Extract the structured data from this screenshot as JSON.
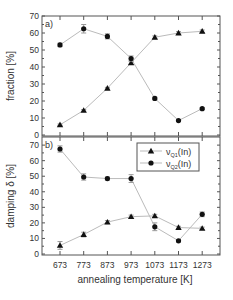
{
  "chart_data": [
    {
      "type": "line",
      "panel_label": "a)",
      "title": "",
      "xlabel": "",
      "ylabel": "fraction [%]",
      "x": [
        673,
        773,
        873,
        973,
        1073,
        1173,
        1273
      ],
      "ylim": [
        0,
        70
      ],
      "yticks": [
        0,
        10,
        20,
        30,
        40,
        50,
        60,
        70
      ],
      "grid": false,
      "series": [
        {
          "name": "ν_Q1(In)",
          "marker": "triangle",
          "values": [
            6,
            14.5,
            27.5,
            42.5,
            57.5,
            60,
            61
          ],
          "errors": [
            0.5,
            0.5,
            0.5,
            1,
            0.8,
            0.8,
            0.8
          ]
        },
        {
          "name": "ν_Q2(In)",
          "marker": "circle",
          "values": [
            53,
            62.5,
            58,
            45,
            21.5,
            8.5,
            15.5
          ],
          "errors": [
            1,
            2.5,
            1.5,
            1.5,
            0.8,
            0.5,
            0.5
          ]
        }
      ]
    },
    {
      "type": "line",
      "panel_label": "b)",
      "title": "",
      "xlabel": "annealing temperature [K]",
      "ylabel": "damping δ [%]",
      "x": [
        673,
        773,
        873,
        973,
        1073,
        1173,
        1273
      ],
      "xticks": [
        "673",
        "773",
        "873",
        "973",
        "1073",
        "1173",
        "1273"
      ],
      "ylim": [
        0,
        72
      ],
      "yticks": [
        0,
        10,
        20,
        30,
        40,
        50,
        60,
        70
      ],
      "grid": false,
      "legend": {
        "position": "upper right",
        "entries": [
          {
            "name": "ν",
            "sub": "Q1",
            "suffix": "(In)",
            "marker": "triangle"
          },
          {
            "name": "ν",
            "sub": "Q2",
            "suffix": "(In)",
            "marker": "circle"
          }
        ]
      },
      "series": [
        {
          "name": "ν_Q1(In)",
          "marker": "triangle",
          "values": [
            5.5,
            12.5,
            20.5,
            24,
            24.5,
            17,
            16.5
          ],
          "errors": [
            2.5,
            1.5,
            1,
            1,
            1,
            0.8,
            0.8
          ]
        },
        {
          "name": "ν_Q2(In)",
          "marker": "circle",
          "values": [
            67.5,
            49.5,
            48.5,
            48.5,
            17.5,
            8.5,
            25.5
          ],
          "errors": [
            2,
            2,
            1,
            2.5,
            2.5,
            0.8,
            1.5
          ]
        }
      ]
    }
  ],
  "colors": {
    "frame": "#555555",
    "line": "#bbbbbb",
    "marker": "#111111",
    "text": "#333333"
  }
}
